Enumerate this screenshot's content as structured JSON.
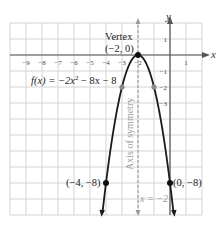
{
  "chart_data": {
    "type": "line",
    "title": "",
    "function_label": "f(x) = -2x^2 - 8x - 8",
    "function_parts": {
      "prefix": "f(x) = −2x",
      "exp": "2",
      "suffix": " − 8x − 8"
    },
    "xlabel": "x",
    "ylabel": "y",
    "xlim": [
      -10,
      2
    ],
    "ylim": [
      -10,
      2
    ],
    "grid": true,
    "x_ticks": [
      -9,
      -8,
      -7,
      -6,
      -5,
      -4,
      -3,
      -2,
      1
    ],
    "y_ticks": [
      1,
      -1,
      -2,
      -3
    ],
    "series": [
      {
        "name": "f(x) = -2x^2 - 8x - 8",
        "x": [
          -4.25,
          -4,
          -3.5,
          -3,
          -2.5,
          -2,
          -1.5,
          -1,
          -0.5,
          0,
          0.25
        ],
        "y": [
          -10.125,
          -8,
          -4.5,
          -2,
          -0.5,
          0,
          -0.5,
          -2,
          -4.5,
          -8,
          -10.125
        ]
      }
    ],
    "points": [
      {
        "x": -2,
        "y": 0,
        "label": "(−2, 0)",
        "color": "#111111"
      },
      {
        "x": -4,
        "y": -8,
        "label": "(−4, −8)",
        "color": "#111111"
      },
      {
        "x": 0,
        "y": -8,
        "label": "(0, −8)",
        "color": "#111111"
      },
      {
        "x": -3,
        "y": -2,
        "label": "",
        "color": "#8a8a8a"
      },
      {
        "x": -1,
        "y": -2,
        "label": "",
        "color": "#8a8a8a"
      }
    ],
    "annotations": [
      {
        "text": "Vertex",
        "target": [
          -2,
          0
        ]
      },
      {
        "text": "(−2, 0)",
        "target": [
          -2,
          0
        ]
      },
      {
        "text": "Axis of symmetry",
        "orientation": "vertical"
      },
      {
        "text": "x = −2",
        "target": "axis of symmetry"
      }
    ],
    "axis_of_symmetry": {
      "x": -2,
      "style": "dashed",
      "color": "#9a9a9a"
    }
  },
  "labels": {
    "x_axis": "x",
    "y_axis": "y",
    "vertex_title": "Vertex",
    "vertex_coords": "(−2, 0)",
    "left_point": "(−4, −8)",
    "right_point": "(0, −8)",
    "axis_sym": "Axis of symmetry",
    "axis_eq": "x = −2",
    "fx_prefix": "f(x) = −2x",
    "fx_exp": "2",
    "fx_suffix": " − 8x − 8"
  },
  "ticks": {
    "x": [
      "−9",
      "−8",
      "−7",
      "−6",
      "−5",
      "−4",
      "−3",
      "−2",
      "1"
    ],
    "y": [
      "1",
      "−1",
      "−2",
      "−3"
    ]
  },
  "colors": {
    "grid": "#d4d4d4",
    "axis": "#555555",
    "curve": "#1a1a1a",
    "symmetry": "#9a9a9a",
    "gray_point": "#8a8a8a"
  }
}
